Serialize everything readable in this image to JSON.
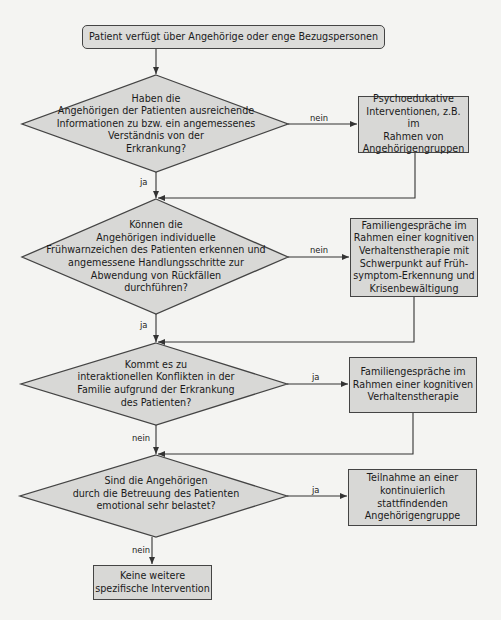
{
  "flowchart": {
    "start": {
      "label": "Patient verfügt über Angehörige oder enge Bezugspersonen"
    },
    "decisions": [
      {
        "label": "Haben die\nAngehörigen der Patienten ausreichende\nInformationen zu bzw. ein angemessenes\nVerständnis von der\nErkrankung?",
        "side_branch_label": "nein",
        "down_branch_label": "ja"
      },
      {
        "label": "Können die\nAngehörigen  individuelle\nFrühwarnzeichen  des Patienten erkennen und\nangemessene Handlungsschritte zur\nAbwendung von Rückfällen\ndurchführen?",
        "side_branch_label": "nein",
        "down_branch_label": "ja"
      },
      {
        "label": "Kommt es zu\ninteraktionellen Konflikten in der\nFamilie aufgrund der Erkrankung\ndes Patienten?",
        "side_branch_label": "ja",
        "down_branch_label": "nein"
      },
      {
        "label": "Sind die Angehörigen\ndurch die Betreuung des Patienten\nemotional sehr belastet?",
        "side_branch_label": "ja",
        "down_branch_label": "nein"
      }
    ],
    "interventions": [
      {
        "label": "Psychoedukative\nInterventionen, z.B. im\nRahmen von\nAngehörigengruppen"
      },
      {
        "label": "Familiengespräche im\nRahmen einer kognitiven\nVerhaltenstherapie mit\nSchwerpunkt auf Früh-\nsymptom-Erkennung und\nKrisenbewältigung"
      },
      {
        "label": "Familiengespräche im\nRahmen einer kognitiven\nVerhaltenstherapie"
      },
      {
        "label": "Teilnahme an einer\nkontinuierlich\nstattfindenden\nAngehörigengruppe"
      }
    ],
    "end": {
      "label": "Keine weitere\nspezifische Intervention"
    },
    "colors": {
      "background": "#f4f4f2",
      "node_fill": "#d8d8d6",
      "stroke": "#444444"
    }
  }
}
